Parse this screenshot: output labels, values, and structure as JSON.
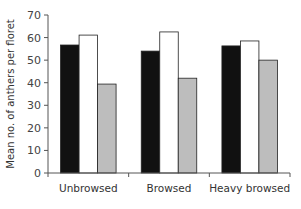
{
  "chart_data": {
    "type": "bar",
    "title": "",
    "xlabel": "",
    "ylabel": "Mean no. of anthers per floret",
    "ylim": [
      0,
      70
    ],
    "yticks": [
      0,
      10,
      20,
      30,
      40,
      50,
      60,
      70
    ],
    "grid": false,
    "legend": null,
    "categories": [
      "Unbrowsed",
      "Browsed",
      "Heavy browsed"
    ],
    "series": [
      {
        "name": "Series 1 (black)",
        "color": "#111111",
        "values": [
          56.7,
          54.0,
          56.3
        ]
      },
      {
        "name": "Series 2 (white)",
        "color": "#ffffff",
        "values": [
          61.1,
          62.5,
          58.5
        ]
      },
      {
        "name": "Series 3 (gray)",
        "color": "#bdbdbd",
        "values": [
          39.4,
          42.0,
          50.0
        ]
      }
    ]
  }
}
